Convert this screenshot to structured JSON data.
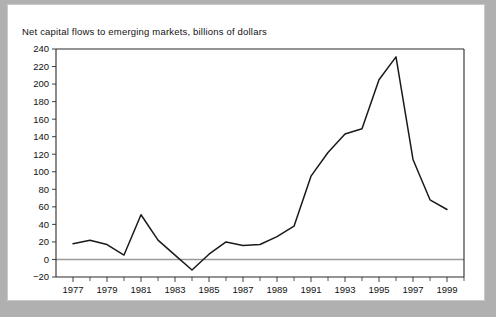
{
  "figure": {
    "background_color": "#b0b0b0",
    "sheet_color": "#ffffff"
  },
  "chart_data": {
    "type": "line",
    "title": "Net capital flows to emerging markets, billions of dollars",
    "xlabel": "",
    "ylabel": "",
    "xlim": [
      1976,
      2000
    ],
    "ylim": [
      -20,
      240
    ],
    "grid": false,
    "legend": null,
    "line_color": "#1a1a1a",
    "zero_line_color": "#9a9a9a",
    "y_ticks": [
      -20,
      0,
      20,
      40,
      60,
      80,
      100,
      120,
      140,
      160,
      180,
      200,
      220,
      240
    ],
    "y_tick_labels": [
      "-20",
      "0",
      "20",
      "40",
      "60",
      "80",
      "100",
      "120",
      "140",
      "160",
      "180",
      "200",
      "220",
      "240"
    ],
    "x_ticks": [
      1977,
      1979,
      1981,
      1983,
      1985,
      1987,
      1989,
      1991,
      1993,
      1995,
      1997,
      1999
    ],
    "x_tick_labels": [
      "1977",
      "1979",
      "1981",
      "1983",
      "1985",
      "1987",
      "1989",
      "1991",
      "1993",
      "1995",
      "1997",
      "1999"
    ],
    "x_minor_ticks": [
      1978,
      1980,
      1982,
      1984,
      1986,
      1988,
      1990,
      1992,
      1994,
      1996,
      1998,
      2000
    ],
    "x": [
      1977,
      1978,
      1979,
      1980,
      1981,
      1982,
      1983,
      1984,
      1985,
      1986,
      1987,
      1988,
      1989,
      1990,
      1991,
      1992,
      1993,
      1994,
      1995,
      1996,
      1997,
      1998,
      1999
    ],
    "values": [
      18,
      22,
      17,
      5,
      51,
      22,
      5,
      -12,
      6,
      20,
      16,
      17,
      26,
      38,
      95,
      122,
      143,
      149,
      205,
      231,
      114,
      68,
      57
    ],
    "series": [
      {
        "name": "Net capital flows to emerging markets",
        "values": [
          18,
          22,
          17,
          5,
          51,
          22,
          5,
          -12,
          6,
          20,
          16,
          17,
          26,
          38,
          95,
          122,
          143,
          149,
          205,
          231,
          114,
          68,
          57
        ]
      }
    ]
  }
}
